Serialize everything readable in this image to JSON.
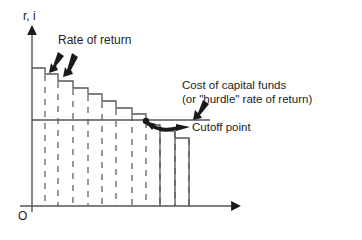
{
  "diagram": {
    "y_axis_label": "r, i",
    "origin_label": "O",
    "labels": {
      "rate_of_return": "Rate of return",
      "cost_of_capital_line1": "Cost of capital funds",
      "cost_of_capital_line2": "(or \"hurdle\" rate of return)",
      "cutoff_point": "Cutoff point"
    },
    "colors": {
      "line": "#555555",
      "arrow": "#1a1a1a",
      "background": "#ffffff"
    },
    "steps": [
      {
        "x0": 32,
        "x1": 45,
        "y": 68
      },
      {
        "x0": 45,
        "x1": 58,
        "y": 74
      },
      {
        "x0": 58,
        "x1": 73,
        "y": 81
      },
      {
        "x0": 73,
        "x1": 88,
        "y": 88
      },
      {
        "x0": 88,
        "x1": 102,
        "y": 94
      },
      {
        "x0": 102,
        "x1": 116,
        "y": 101
      },
      {
        "x0": 116,
        "x1": 132,
        "y": 108
      },
      {
        "x0": 132,
        "x1": 146,
        "y": 114
      },
      {
        "x0": 146,
        "x1": 160,
        "y": 125
      },
      {
        "x0": 160,
        "x1": 175,
        "y": 131
      },
      {
        "x0": 175,
        "x1": 189,
        "y": 138
      }
    ],
    "hurdle_y": 120,
    "cutoff_x": 146
  }
}
